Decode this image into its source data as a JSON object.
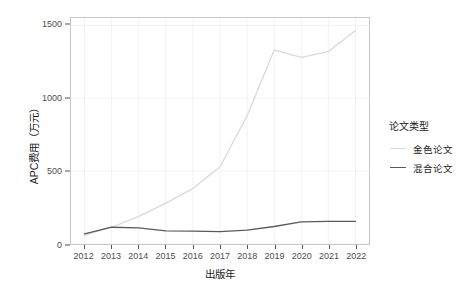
{
  "chart_data": {
    "type": "line",
    "title": "",
    "xlabel": "出版年",
    "ylabel": "APC费用（万元）",
    "x": [
      2012,
      2013,
      2014,
      2015,
      2016,
      2017,
      2018,
      2019,
      2020,
      2021,
      2022
    ],
    "xtick_labels": [
      "2012",
      "2013",
      "2014",
      "2015",
      "2016",
      "2017",
      "2018",
      "2019",
      "2020",
      "2021",
      "2022"
    ],
    "ytick_labels": [
      "0",
      "500",
      "1000",
      "1500"
    ],
    "yticks": [
      0,
      500,
      1000,
      1500
    ],
    "xlim": [
      2011.5,
      2022.5
    ],
    "ylim": [
      0,
      1550
    ],
    "grid": true,
    "legend_position": "right",
    "legend_title": "论文类型",
    "series": [
      {
        "name": "金色论文",
        "color": "#d9d9d9",
        "values": [
          60,
          115,
          190,
          280,
          380,
          530,
          880,
          1330,
          1280,
          1320,
          1465
        ]
      },
      {
        "name": "混合论文",
        "color": "#5a5a5a",
        "values": [
          70,
          115,
          110,
          90,
          88,
          85,
          95,
          120,
          152,
          155,
          155
        ]
      }
    ]
  },
  "axes": {
    "y_title": "APC费用（万元）",
    "x_title": "出版年"
  },
  "legend": {
    "title": "论文类型",
    "items": [
      {
        "label": "金色论文",
        "color": "#d9d9d9"
      },
      {
        "label": "混合论文",
        "color": "#5a5a5a"
      }
    ]
  },
  "colors": {
    "panel_background": "#ffffff",
    "panel_border": "#c8c8c8",
    "grid": "#f2f2f2",
    "axis_text": "#4d4d4d",
    "title_text": "#1a1a1a"
  }
}
